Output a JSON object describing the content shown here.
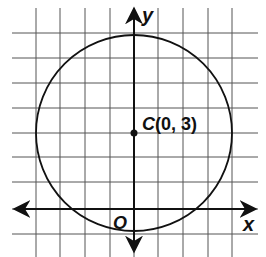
{
  "figure": {
    "type": "coordinate-grid-circle",
    "grid": {
      "x_lines": [
        36,
        60,
        85,
        110,
        134,
        158,
        183,
        208,
        232
      ],
      "y_lines": [
        33,
        58,
        83,
        108,
        133,
        157,
        182,
        209,
        234
      ],
      "x_extent": [
        12,
        258
      ],
      "y_extent": [
        8,
        257
      ],
      "color": "#555555"
    },
    "axes": {
      "x_label": "x",
      "y_label": "y",
      "origin_label": "O",
      "color": "#111111"
    },
    "circle": {
      "center": {
        "x": 0,
        "y": 3
      },
      "radius_units": 4,
      "center_label_letter": "C",
      "center_label_coords": "(0, 3)"
    }
  }
}
